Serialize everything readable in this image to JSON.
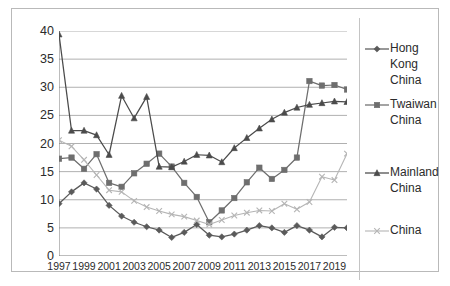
{
  "chart_data": {
    "type": "line",
    "title": "",
    "xlabel": "",
    "ylabel": "",
    "xlim": [
      1997,
      2020
    ],
    "ylim": [
      0,
      40
    ],
    "ytick_step": 5,
    "grid": true,
    "legend_position": "right",
    "x": [
      1997,
      1998,
      1999,
      2000,
      2001,
      2002,
      2003,
      2004,
      2005,
      2006,
      2007,
      2008,
      2009,
      2010,
      2011,
      2012,
      2013,
      2014,
      2015,
      2016,
      2017,
      2018,
      2019,
      2020
    ],
    "ytick_labels": [
      "0",
      "5",
      "10",
      "15",
      "20",
      "25",
      "30",
      "35",
      "40"
    ],
    "xtick_labels": [
      "1997",
      "1999",
      "2001",
      "2003",
      "2005",
      "2007",
      "2009",
      "2011",
      "2013",
      "2015",
      "2017",
      "2019"
    ],
    "xtick_label_values": [
      1997,
      1999,
      2001,
      2003,
      2005,
      2007,
      2009,
      2011,
      2013,
      2015,
      2017,
      2019
    ],
    "series": [
      {
        "name": "Hong Kong China",
        "marker": "diamond",
        "color": "#5a5a5a",
        "values": [
          9.3,
          11.4,
          13.0,
          11.9,
          9.0,
          7.1,
          6.0,
          5.2,
          4.6,
          3.3,
          4.2,
          5.6,
          3.7,
          3.4,
          3.9,
          4.6,
          5.4,
          5.0,
          4.2,
          5.4,
          4.6,
          3.4,
          5.1,
          5.0
        ]
      },
      {
        "name": "Twaiwan China",
        "marker": "square",
        "color": "#6e6e6e",
        "values": [
          17.3,
          17.5,
          15.5,
          18.1,
          13.0,
          12.3,
          14.7,
          16.4,
          18.2,
          15.9,
          13.0,
          10.5,
          6.0,
          8.1,
          10.3,
          13.1,
          15.7,
          13.7,
          15.3,
          17.5,
          31.1,
          30.3,
          30.4,
          29.6
        ]
      },
      {
        "name": "Mainland China",
        "marker": "triangle",
        "color": "#4b4b4b",
        "values": [
          39.4,
          22.3,
          22.3,
          21.5,
          18.0,
          28.5,
          24.5,
          28.3,
          15.9,
          15.8,
          16.8,
          18.0,
          17.9,
          16.7,
          19.2,
          21.0,
          22.7,
          24.3,
          25.5,
          26.4,
          26.9,
          27.2,
          27.5,
          27.4
        ]
      },
      {
        "name": "China",
        "marker": "cross",
        "color": "#b5b5b5",
        "values": [
          20.6,
          19.5,
          17.1,
          14.4,
          11.7,
          11.4,
          9.8,
          8.7,
          8.0,
          7.4,
          7.0,
          6.3,
          5.6,
          6.4,
          7.2,
          7.7,
          8.1,
          8.0,
          9.3,
          8.3,
          9.6,
          14.1,
          13.5,
          18.2
        ]
      }
    ]
  },
  "legend": {
    "entries": [
      {
        "label": "Hong Kong China"
      },
      {
        "label": "Twaiwan China"
      },
      {
        "label": "Mainland China"
      },
      {
        "label": "China"
      }
    ]
  }
}
